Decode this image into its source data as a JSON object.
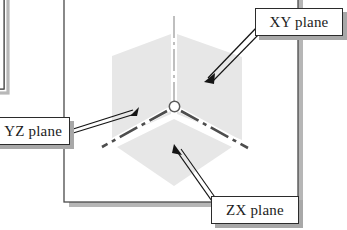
{
  "figure": {
    "background_color": "#ffffff",
    "frame": {
      "border_color": "#4a4a4a",
      "shadow_color": "#b0b0b0",
      "fill_color": "#ffffff"
    },
    "planes": [
      {
        "id": "yz-plane",
        "label": "YZ plane",
        "fill_color": "#e6e6e6",
        "orientation": "left-vertical"
      },
      {
        "id": "xy-plane",
        "label": "XY plane",
        "fill_color": "#e6e6e6",
        "orientation": "right-vertical"
      },
      {
        "id": "zx-plane",
        "label": "ZX plane",
        "fill_color": "#e6e6e6",
        "orientation": "bottom-horizontal"
      }
    ],
    "axes": {
      "line_style": "dash-dot",
      "vertical_axis_color": "#b4b4b4",
      "left_axis_color": "#4a4a4a",
      "right_axis_color": "#4a4a4a",
      "origin_marker": "open-circle",
      "origin_fill": "#ffffff",
      "origin_stroke": "#555555"
    },
    "callouts": [
      {
        "id": "callout-xy",
        "text": "XY plane",
        "points_to": "xy-plane"
      },
      {
        "id": "callout-yz",
        "text": "YZ plane",
        "points_to": "yz-plane"
      },
      {
        "id": "callout-zx",
        "text": "ZX plane",
        "points_to": "zx-plane"
      }
    ],
    "arrows": {
      "color": "#1a1a1a",
      "head_style": "solid-triangle"
    }
  }
}
